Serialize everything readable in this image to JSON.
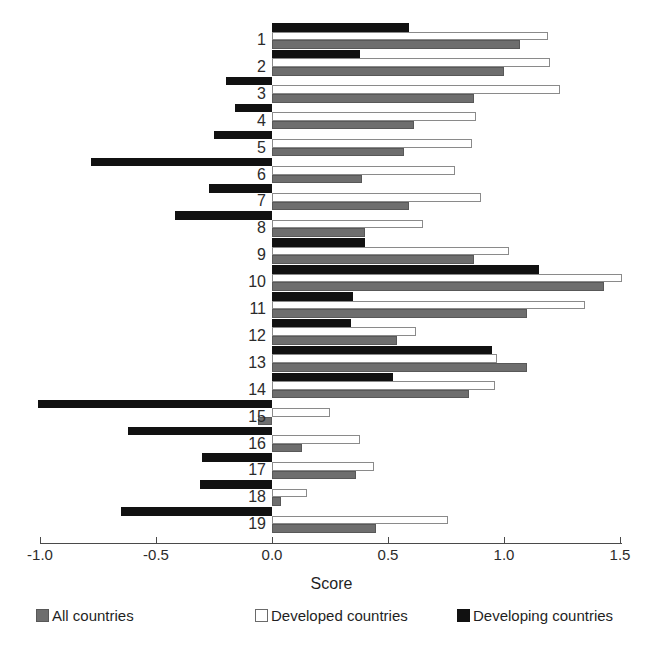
{
  "chart_data": {
    "type": "bar",
    "orientation": "horizontal",
    "title": "",
    "xlabel": "Score",
    "ylabel": "",
    "xlim": [
      -1.0,
      1.5
    ],
    "xticks": [
      "-1.0",
      "-0.5",
      "0.0",
      "0.5",
      "1.0",
      "1.5"
    ],
    "xtick_values": [
      -1.0,
      -0.5,
      0.0,
      0.5,
      1.0,
      1.5
    ],
    "grid": false,
    "legend_position": "bottom",
    "categories": [
      "1",
      "2",
      "3",
      "4",
      "5",
      "6",
      "7",
      "8",
      "9",
      "10",
      "11",
      "12",
      "13",
      "14",
      "15",
      "16",
      "17",
      "18",
      "19"
    ],
    "series": [
      {
        "name": "Developing countries",
        "color": "#111111",
        "values": [
          0.59,
          0.38,
          -0.2,
          -0.16,
          -0.25,
          -0.78,
          -0.27,
          -0.42,
          0.4,
          1.15,
          0.35,
          0.34,
          0.95,
          0.52,
          -1.01,
          -0.62,
          -0.3,
          -0.31,
          -0.65
        ]
      },
      {
        "name": "Developed countries",
        "color": "#ffffff",
        "values": [
          1.19,
          1.2,
          1.24,
          0.88,
          0.86,
          0.79,
          0.9,
          0.65,
          1.02,
          1.51,
          1.35,
          0.62,
          0.97,
          0.96,
          0.25,
          0.38,
          0.44,
          0.15,
          0.76
        ]
      },
      {
        "name": "All countries",
        "color": "#6e6e6e",
        "values": [
          1.07,
          1.0,
          0.87,
          0.61,
          0.57,
          0.39,
          0.59,
          0.4,
          0.87,
          1.43,
          1.1,
          0.54,
          1.1,
          0.85,
          -0.06,
          0.13,
          0.36,
          0.04,
          0.45
        ]
      }
    ]
  },
  "legend": {
    "items": [
      {
        "label": "All countries",
        "swatch": "swatch-all-countries"
      },
      {
        "label": "Developed countries",
        "swatch": "swatch-developed-countries"
      },
      {
        "label": "Developing countries",
        "swatch": "swatch-developing-countries"
      }
    ]
  },
  "axis": {
    "x_title": "Score"
  }
}
